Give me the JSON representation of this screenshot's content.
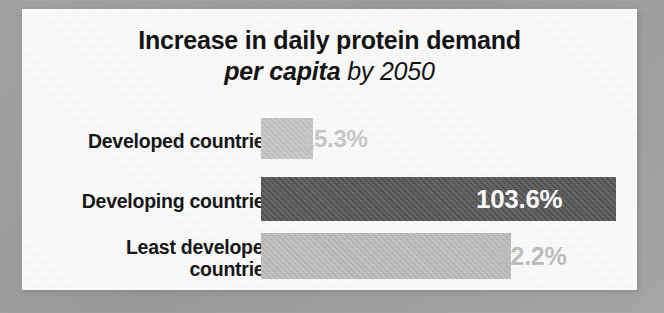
{
  "title": {
    "line1": "Increase in daily protein demand",
    "line2_bold_italic": "per capita",
    "line2_italic": " by 2050"
  },
  "colors": {
    "page_border": "#9e9e9e",
    "card_background": "#fdfdfd",
    "label_text": "#131313",
    "bar_light": "#c6c6c6",
    "bar_light_alt": "#bdbdbd",
    "bar_dark": "#545454",
    "value_light": "#c9c9c9",
    "value_light_alt": "#bfbfbf",
    "value_on_dark": "#ffffff"
  },
  "chart_data": {
    "type": "bar",
    "orientation": "horizontal",
    "title": "Increase in daily protein demand per capita by 2050",
    "xlabel": "",
    "ylabel": "",
    "grid": false,
    "legend": null,
    "axis_visible": false,
    "xlim": [
      0,
      110
    ],
    "unit": "%",
    "categories": [
      "Developed countries",
      "Developing countries",
      "Least developed countries"
    ],
    "values": [
      15.3,
      103.6,
      62.2
    ],
    "value_labels": [
      "15.3%",
      "103.6%",
      "62.2%"
    ]
  },
  "bars": [
    {
      "label_lines": [
        "Developed countries"
      ],
      "value_label": "15.3%",
      "value": 15.3,
      "bar_color": "#c6c6c6",
      "value_color": "#c9c9c9",
      "value_inside": false,
      "geom": {
        "top": 109,
        "height": 41,
        "width": 52,
        "value_left": 301,
        "value_size": 24
      }
    },
    {
      "label_lines": [
        "Developing countries"
      ],
      "value_label": "103.6%",
      "value": 103.6,
      "bar_color": "#545454",
      "value_color": "#ffffff",
      "value_inside": true,
      "geom": {
        "top": 168,
        "height": 44,
        "width": 355,
        "value_left": 476,
        "value_size": 26
      }
    },
    {
      "label_lines": [
        "Least developed",
        "countries"
      ],
      "value_label": "62.2%",
      "value": 62.2,
      "bar_color": "#bdbdbd",
      "value_color": "#bfbfbf",
      "value_inside": false,
      "geom": {
        "top": 224,
        "height": 46,
        "width": 250,
        "value_left": 497,
        "value_size": 25
      }
    }
  ]
}
